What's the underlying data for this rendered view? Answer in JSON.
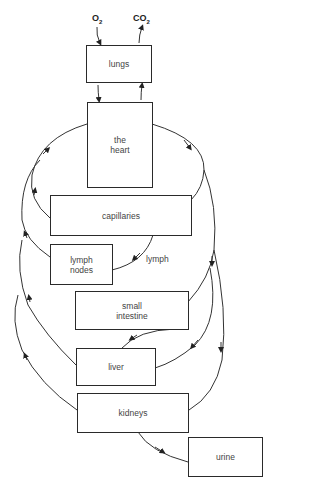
{
  "diagram": {
    "type": "blood circulation flow diagram",
    "inputs": {
      "oxygen": "O",
      "oxygen_sub": "2",
      "carbon_dioxide": "CO",
      "carbon_dioxide_sub": "2"
    },
    "nodes": [
      {
        "id": "lungs",
        "label": "lungs"
      },
      {
        "id": "heart",
        "label": "the\nheart"
      },
      {
        "id": "capillaries",
        "label": "capillaries"
      },
      {
        "id": "lymph_nodes",
        "label": "lymph\nnodes"
      },
      {
        "id": "small_intestine",
        "label": "small\nintestine"
      },
      {
        "id": "liver",
        "label": "liver"
      },
      {
        "id": "kidneys",
        "label": "kidneys"
      },
      {
        "id": "urine",
        "label": "urine"
      }
    ],
    "edge_labels": {
      "lymph": "lymph"
    },
    "edges": [
      {
        "from": "O2",
        "to": "lungs"
      },
      {
        "from": "lungs",
        "to": "CO2"
      },
      {
        "from": "lungs",
        "to": "heart"
      },
      {
        "from": "heart",
        "to": "lungs"
      },
      {
        "from": "heart",
        "to": "capillaries"
      },
      {
        "from": "heart",
        "to": "small_intestine"
      },
      {
        "from": "heart",
        "to": "liver"
      },
      {
        "from": "heart",
        "to": "kidneys"
      },
      {
        "from": "capillaries",
        "to": "heart"
      },
      {
        "from": "capillaries",
        "to": "lymph_nodes",
        "label": "lymph"
      },
      {
        "from": "lymph_nodes",
        "to": "heart"
      },
      {
        "from": "small_intestine",
        "to": "liver"
      },
      {
        "from": "liver",
        "to": "heart"
      },
      {
        "from": "kidneys",
        "to": "heart"
      },
      {
        "from": "kidneys",
        "to": "urine"
      }
    ]
  }
}
